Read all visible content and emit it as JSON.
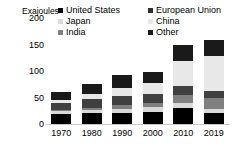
{
  "chart_data": {
    "type": "bar",
    "stacked": true,
    "title": "",
    "subtitle": "",
    "xlabel": "",
    "ylabel": "Exajoules",
    "ylim": [
      0,
      200
    ],
    "yticks": [
      0,
      50,
      100,
      150,
      200
    ],
    "grid": false,
    "legend_position": "top",
    "categories": [
      "1970",
      "1980",
      "1990",
      "2000",
      "2010",
      "2019"
    ],
    "series": [
      {
        "name": "United States",
        "color": "#000000",
        "values": [
          19,
          20,
          21,
          23,
          31,
          21
        ]
      },
      {
        "name": "Japan",
        "color": "#d9d9d9",
        "values": [
          5,
          7,
          8,
          9,
          9,
          7
        ]
      },
      {
        "name": "India",
        "color": "#808080",
        "values": [
          3,
          4,
          6,
          8,
          15,
          21
        ]
      },
      {
        "name": "European Union",
        "color": "#404040",
        "values": [
          13,
          16,
          17,
          17,
          16,
          14
        ]
      },
      {
        "name": "China",
        "color": "#e8e8e8",
        "values": [
          6,
          10,
          16,
          21,
          48,
          66
        ]
      },
      {
        "name": "Other",
        "color": "#1a1a1a",
        "values": [
          14,
          18,
          24,
          21,
          31,
          29
        ]
      }
    ],
    "totals": [
      60,
      75,
      92,
      99,
      150,
      158
    ]
  },
  "legend": {
    "columns": [
      {
        "items": [
          {
            "label": "United States",
            "swatch": "#000000"
          },
          {
            "label": "Japan",
            "swatch": "#d9d9d9"
          },
          {
            "label": "India",
            "swatch": "#808080"
          }
        ]
      },
      {
        "items": [
          {
            "label": "European Union",
            "swatch": "#303030"
          },
          {
            "label": "China",
            "swatch": "#e8e8e8"
          },
          {
            "label": "Other",
            "swatch": "#1a1a1a"
          }
        ]
      }
    ]
  },
  "axes": {
    "y_axis_title": "Exajoules",
    "y_tick_labels": [
      "200",
      "150",
      "100",
      "50",
      "0"
    ],
    "x_tick_labels": [
      "1970",
      "1980",
      "1990",
      "2000",
      "2010",
      "2019"
    ]
  },
  "colors": {
    "background": "#ffffff",
    "axis_line": "#c9c9c9",
    "text": "#000000"
  }
}
